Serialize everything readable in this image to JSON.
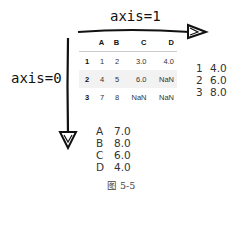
{
  "axis_top": {
    "label": "axis=1"
  },
  "axis_left": {
    "label": "axis=0"
  },
  "table": {
    "columns": [
      "",
      "A",
      "B",
      "C",
      "D"
    ],
    "rows": [
      [
        "1",
        "1",
        "2",
        "3.0",
        "4.0"
      ],
      [
        "2",
        "4",
        "5",
        "6.0",
        "NaN"
      ],
      [
        "3",
        "7",
        "8",
        "NaN",
        "NaN"
      ]
    ]
  },
  "result_axis1": {
    "items": [
      {
        "key": "1",
        "value": "4.0"
      },
      {
        "key": "2",
        "value": "6.0"
      },
      {
        "key": "3",
        "value": "8.0"
      }
    ]
  },
  "result_axis0": {
    "items": [
      {
        "key": "A",
        "value": "7.0"
      },
      {
        "key": "B",
        "value": "8.0"
      },
      {
        "key": "C",
        "value": "6.0"
      },
      {
        "key": "D",
        "value": "4.0"
      }
    ]
  },
  "caption": "图 5-5"
}
